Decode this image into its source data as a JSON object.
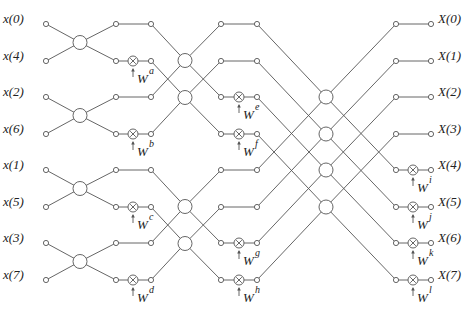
{
  "colors": {
    "line": "#555555",
    "text": "#222222",
    "background": "#ffffff"
  },
  "rows_y": [
    24,
    61,
    97,
    134,
    170,
    207,
    243,
    280
  ],
  "columns_x": {
    "input": 46,
    "s1_bfly": 80,
    "s1_out": 116,
    "s1_mult": 133,
    "s1_end": 151,
    "s2_bfly": 185,
    "s2_out": 221,
    "s2_mult": 239,
    "s2_end": 257,
    "s3_bfly": 326,
    "s3_out": 396,
    "s3_mult": 413,
    "s3_end": 431
  },
  "inputs": [
    "x(0)",
    "x(4)",
    "x(2)",
    "x(6)",
    "x(1)",
    "x(5)",
    "x(3)",
    "x(7)"
  ],
  "outputs": [
    "X(0)",
    "X(1)",
    "X(2)",
    "X(3)",
    "X(4)",
    "X(5)",
    "X(6)",
    "X(7)"
  ],
  "stages": [
    {
      "name": "stage-1",
      "pairs": [
        [
          0,
          1
        ],
        [
          2,
          3
        ],
        [
          4,
          5
        ],
        [
          6,
          7
        ]
      ],
      "twiddles": [
        {
          "row": 1,
          "sup": "a"
        },
        {
          "row": 3,
          "sup": "b"
        },
        {
          "row": 5,
          "sup": "c"
        },
        {
          "row": 7,
          "sup": "d"
        }
      ]
    },
    {
      "name": "stage-2",
      "pairs": [
        [
          0,
          2
        ],
        [
          1,
          3
        ],
        [
          4,
          6
        ],
        [
          5,
          7
        ]
      ],
      "twiddles": [
        {
          "row": 2,
          "sup": "e"
        },
        {
          "row": 3,
          "sup": "f"
        },
        {
          "row": 6,
          "sup": "g"
        },
        {
          "row": 7,
          "sup": "h"
        }
      ]
    },
    {
      "name": "stage-3",
      "pairs": [
        [
          0,
          4
        ],
        [
          1,
          5
        ],
        [
          2,
          6
        ],
        [
          3,
          7
        ]
      ],
      "twiddles": [
        {
          "row": 4,
          "sup": "i"
        },
        {
          "row": 5,
          "sup": "j"
        },
        {
          "row": 6,
          "sup": "k"
        },
        {
          "row": 7,
          "sup": "l"
        }
      ]
    }
  ],
  "twiddle_base": "W",
  "icons": {
    "multiplier": "circle-times-icon",
    "node": "small-circle-node",
    "butterfly": "butterfly-junction-circle"
  }
}
